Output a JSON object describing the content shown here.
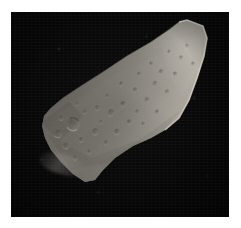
{
  "page": {
    "kind": "natural-image-photograph",
    "caption": ""
  },
  "canvas": {
    "width_px": 241,
    "height_px": 228,
    "margin_color": "#ffffff"
  },
  "image_plate": {
    "name": "space-background",
    "left_px": 11,
    "top_px": 12,
    "width_px": 218,
    "height_px": 205,
    "background_color": "#070707",
    "description": "black star-field background of deep space"
  },
  "subject": {
    "name": "asteroid",
    "common_name": "Gaspra",
    "shape": "irregular elongated wedge",
    "orientation": "long axis running from upper-right to lower-left",
    "surface": "heavily cratered regolith with subtle facets",
    "illumination": "sunlit from the upper right; terminator shadow along the upper-left flank",
    "colors": {
      "highlight": "#c9c5bb",
      "midtone": "#9a958c",
      "shadow": "#4a4741",
      "deep_shadow": "#23211e",
      "limb_glow": "#ded9cf"
    },
    "outline_points": [
      [
        176,
        8
      ],
      [
        192,
        14
      ],
      [
        196,
        26
      ],
      [
        193,
        44
      ],
      [
        186,
        66
      ],
      [
        178,
        88
      ],
      [
        168,
        106
      ],
      [
        154,
        118
      ],
      [
        140,
        126
      ],
      [
        122,
        134
      ],
      [
        104,
        146
      ],
      [
        92,
        158
      ],
      [
        84,
        168
      ],
      [
        74,
        170
      ],
      [
        62,
        162
      ],
      [
        50,
        150
      ],
      [
        40,
        138
      ],
      [
        34,
        126
      ],
      [
        31,
        114
      ],
      [
        33,
        104
      ],
      [
        40,
        96
      ],
      [
        52,
        86
      ],
      [
        70,
        74
      ],
      [
        92,
        60
      ],
      [
        116,
        44
      ],
      [
        140,
        30
      ],
      [
        158,
        18
      ],
      [
        168,
        10
      ]
    ],
    "craters": [
      {
        "cx": 62,
        "cy": 112,
        "r": 7.0
      },
      {
        "cx": 47,
        "cy": 122,
        "r": 4.0
      },
      {
        "cx": 55,
        "cy": 134,
        "r": 3.2
      },
      {
        "cx": 70,
        "cy": 128,
        "r": 2.6
      },
      {
        "cx": 84,
        "cy": 120,
        "r": 3.4
      },
      {
        "cx": 95,
        "cy": 131,
        "r": 2.4
      },
      {
        "cx": 106,
        "cy": 120,
        "r": 3.0
      },
      {
        "cx": 118,
        "cy": 110,
        "r": 2.6
      },
      {
        "cx": 100,
        "cy": 101,
        "r": 3.6
      },
      {
        "cx": 86,
        "cy": 96,
        "r": 2.6
      },
      {
        "cx": 74,
        "cy": 100,
        "r": 2.2
      },
      {
        "cx": 112,
        "cy": 92,
        "r": 2.8
      },
      {
        "cx": 126,
        "cy": 100,
        "r": 2.4
      },
      {
        "cx": 136,
        "cy": 88,
        "r": 2.6
      },
      {
        "cx": 124,
        "cy": 78,
        "r": 2.4
      },
      {
        "cx": 110,
        "cy": 72,
        "r": 2.2
      },
      {
        "cx": 144,
        "cy": 72,
        "r": 2.8
      },
      {
        "cx": 156,
        "cy": 80,
        "r": 2.4
      },
      {
        "cx": 150,
        "cy": 60,
        "r": 2.6
      },
      {
        "cx": 164,
        "cy": 62,
        "r": 2.2
      },
      {
        "cx": 170,
        "cy": 46,
        "r": 2.4
      },
      {
        "cx": 158,
        "cy": 40,
        "r": 2.0
      },
      {
        "cx": 140,
        "cy": 52,
        "r": 2.2
      },
      {
        "cx": 128,
        "cy": 62,
        "r": 2.0
      },
      {
        "cx": 96,
        "cy": 84,
        "r": 2.0
      },
      {
        "cx": 66,
        "cy": 92,
        "r": 2.0
      },
      {
        "cx": 50,
        "cy": 106,
        "r": 2.6
      },
      {
        "cx": 78,
        "cy": 140,
        "r": 2.2
      },
      {
        "cx": 64,
        "cy": 146,
        "r": 2.6
      },
      {
        "cx": 90,
        "cy": 110,
        "r": 2.0
      },
      {
        "cx": 132,
        "cy": 112,
        "r": 2.0
      },
      {
        "cx": 146,
        "cy": 100,
        "r": 2.2
      },
      {
        "cx": 176,
        "cy": 34,
        "r": 2.0
      },
      {
        "cx": 182,
        "cy": 52,
        "r": 2.2
      }
    ],
    "dust_spur": {
      "name": "lower-left-dust-spur",
      "left_px": 28,
      "top_px": 142,
      "width_px": 46,
      "height_px": 20
    }
  }
}
